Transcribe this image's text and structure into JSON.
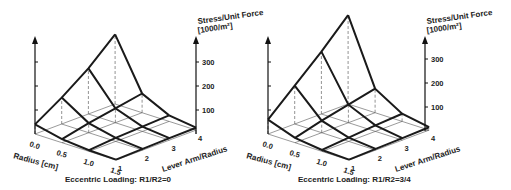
{
  "chart_data": [
    {
      "type": "surface3d",
      "title": "Eccentric Loading:  R1/R2=0",
      "zlabel_line1": "Stress/Unit Force",
      "zlabel_line2": "[1000/m²]",
      "xlabel": "Radius [cm]",
      "ylabel": "Lever Arm/Radius",
      "radius_ticks": [
        "0.0",
        "0.5",
        "1.0",
        "1.5"
      ],
      "lever_ticks": [
        "1",
        "2",
        "3",
        "4"
      ],
      "z_ticks": [
        "100",
        "200",
        "300"
      ],
      "zlim": [
        0,
        400
      ],
      "radius": [
        0.0,
        0.5,
        1.0,
        1.5
      ],
      "lever": [
        1,
        2,
        3,
        4
      ],
      "z": [
        [
          40,
          110,
          190,
          290
        ],
        [
          15,
          40,
          60,
          80
        ],
        [
          5,
          15,
          20,
          25
        ],
        [
          2,
          5,
          8,
          10
        ]
      ]
    },
    {
      "type": "surface3d",
      "title": "Eccentric Loading:  R1/R2=3/4",
      "zlabel_line1": "Stress/Unit Force",
      "zlabel_line2": "[1000/m²]",
      "xlabel": "Radius [cm]",
      "ylabel": "Lever Arm/Radius",
      "radius_ticks": [
        "0.0",
        "0.5",
        "1.0",
        "1.5"
      ],
      "lever_ticks": [
        "1",
        "2",
        "3",
        "4"
      ],
      "z_ticks": [
        "100",
        "200",
        "300"
      ],
      "zlim": [
        0,
        400
      ],
      "radius": [
        0.0,
        0.5,
        1.0,
        1.5
      ],
      "lever": [
        1,
        2,
        3,
        4
      ],
      "z": [
        [
          60,
          160,
          260,
          370
        ],
        [
          20,
          50,
          75,
          100
        ],
        [
          6,
          16,
          25,
          32
        ],
        [
          2,
          5,
          8,
          12
        ]
      ]
    }
  ]
}
